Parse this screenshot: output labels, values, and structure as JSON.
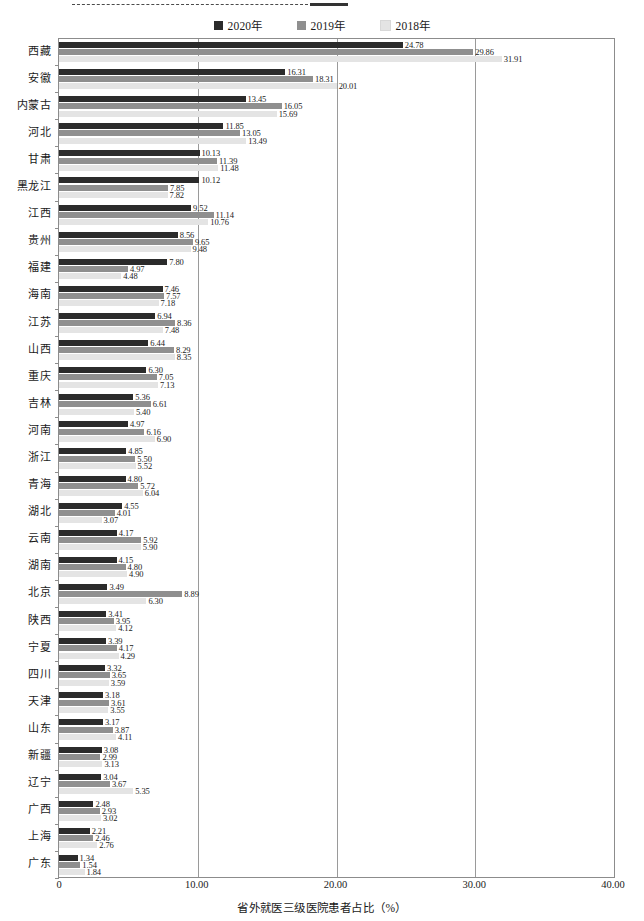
{
  "legend": {
    "items": [
      {
        "label": "2020年",
        "color": "#2b2b2b"
      },
      {
        "label": "2019年",
        "color": "#8f8f8f"
      },
      {
        "label": "2018年",
        "color": "#e4e4e4"
      }
    ]
  },
  "axis": {
    "x_title": "省外就医三级医院患者占比（%）",
    "x_ticks": [
      "0",
      "10.00",
      "20.00",
      "30.00",
      "40.00"
    ]
  },
  "chart_data": {
    "type": "bar",
    "orientation": "horizontal",
    "title": "",
    "xlabel": "省外就医三级医院患者占比（%）",
    "ylabel": "",
    "xlim": [
      0,
      40
    ],
    "grid": true,
    "legend_position": "top-center",
    "categories": [
      "西藏",
      "安徽",
      "内蒙古",
      "河北",
      "甘肃",
      "黑龙江",
      "江西",
      "贵州",
      "福建",
      "海南",
      "江苏",
      "山西",
      "重庆",
      "吉林",
      "河南",
      "浙江",
      "青海",
      "湖北",
      "云南",
      "湖南",
      "北京",
      "陕西",
      "宁夏",
      "四川",
      "天津",
      "山东",
      "新疆",
      "辽宁",
      "广西",
      "上海",
      "广东"
    ],
    "series": [
      {
        "name": "2020年",
        "color": "#2b2b2b",
        "values": [
          24.78,
          16.31,
          13.45,
          11.85,
          10.13,
          10.12,
          9.52,
          8.56,
          7.8,
          7.46,
          6.94,
          6.44,
          6.3,
          5.36,
          4.97,
          4.85,
          4.8,
          4.55,
          4.17,
          4.15,
          3.49,
          3.41,
          3.39,
          3.32,
          3.18,
          3.17,
          3.08,
          3.04,
          2.48,
          2.21,
          1.34
        ]
      },
      {
        "name": "2019年",
        "color": "#8f8f8f",
        "values": [
          29.86,
          18.31,
          16.05,
          13.05,
          11.39,
          7.85,
          11.14,
          9.65,
          4.97,
          7.57,
          8.36,
          8.29,
          7.05,
          6.61,
          6.16,
          5.5,
          5.72,
          4.01,
          5.92,
          4.8,
          8.89,
          3.95,
          4.17,
          3.65,
          3.61,
          3.87,
          2.99,
          3.67,
          2.93,
          2.46,
          1.54
        ]
      },
      {
        "name": "2018年",
        "color": "#e4e4e4",
        "values": [
          31.91,
          20.01,
          15.69,
          13.49,
          11.48,
          7.82,
          10.76,
          9.48,
          4.48,
          7.18,
          7.48,
          8.35,
          7.13,
          5.4,
          6.9,
          5.52,
          6.04,
          3.07,
          5.9,
          4.9,
          6.3,
          4.12,
          4.29,
          3.59,
          3.55,
          4.11,
          3.13,
          5.35,
          3.02,
          2.76,
          1.84
        ]
      }
    ]
  }
}
